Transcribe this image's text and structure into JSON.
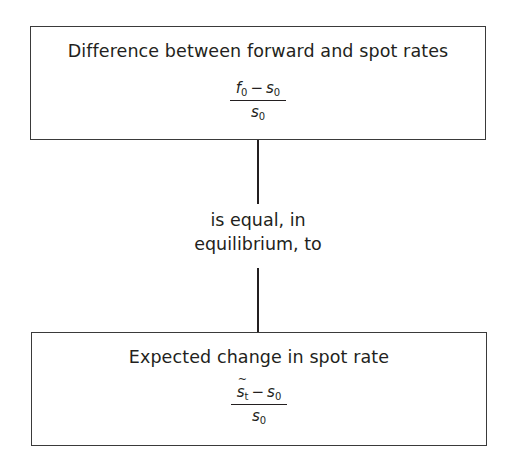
{
  "diagram": {
    "top_box": {
      "title": "Difference between forward and spot rates",
      "formula": {
        "numerator_a": "f",
        "numerator_a_sub": "0",
        "operator": "−",
        "numerator_b": "s",
        "numerator_b_sub": "0",
        "denominator": "s",
        "denominator_sub": "0"
      }
    },
    "connector_label": {
      "line1": "is equal, in",
      "line2": "equilibrium, to"
    },
    "bottom_box": {
      "title": "Expected change in spot rate",
      "formula": {
        "numerator_a": "s",
        "numerator_a_sub": "t",
        "numerator_a_accent": "tilde",
        "operator": "−",
        "numerator_b": "s",
        "numerator_b_sub": "0",
        "denominator": "s",
        "denominator_sub": "0"
      }
    },
    "colors": {
      "stroke": "#3a3a3a",
      "text": "#231f20",
      "background": "#ffffff"
    }
  }
}
